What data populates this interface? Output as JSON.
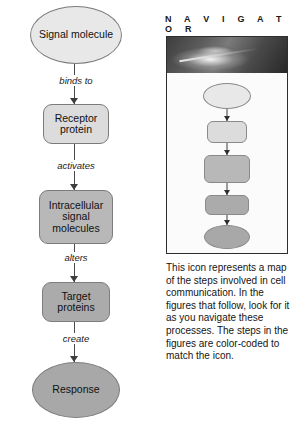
{
  "flowchart": {
    "nodes": [
      {
        "id": "signal",
        "label": "Signal molecule",
        "shape": "ellipse",
        "color": "#e8e8e8"
      },
      {
        "id": "receptor",
        "label": "Receptor protein",
        "shape": "rounded-rect",
        "color": "#dcdcdc"
      },
      {
        "id": "intracell",
        "label": "Intracellular signal molecules",
        "shape": "rounded-rect",
        "color": "#b8b8b8"
      },
      {
        "id": "target",
        "label": "Target proteins",
        "shape": "rounded-rect",
        "color": "#ababab"
      },
      {
        "id": "response",
        "label": "Response",
        "shape": "ellipse",
        "color": "#a8a8a8"
      }
    ],
    "edges": [
      {
        "from": "signal",
        "to": "receptor",
        "label": "binds to"
      },
      {
        "from": "receptor",
        "to": "intracell",
        "label": "activates"
      },
      {
        "from": "intracell",
        "to": "target",
        "label": "alters"
      },
      {
        "from": "target",
        "to": "response",
        "label": "create"
      }
    ]
  },
  "navigator": {
    "title": "N A V I G A T O R",
    "photo_alt": "micrograph-band",
    "mini_steps": [
      {
        "shape": "ellipse",
        "color": "#e8e8e8"
      },
      {
        "shape": "rounded-rect",
        "color": "#dcdcdc"
      },
      {
        "shape": "rounded-rect",
        "color": "#b8b8b8"
      },
      {
        "shape": "rounded-rect",
        "color": "#ababab"
      },
      {
        "shape": "ellipse",
        "color": "#a8a8a8"
      }
    ],
    "caption": "This icon represents a map of the steps involved in cell communication. In the figures that follow, look for it as you navigate these processes. The steps in the figures are color-coded to match the icon."
  }
}
